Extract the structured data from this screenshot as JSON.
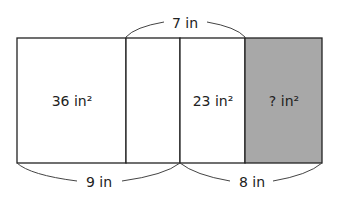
{
  "diagram": {
    "top_brace_label": "7 in",
    "bottom_left_brace_label": "9 in",
    "bottom_right_brace_label": "8 in",
    "regions": [
      {
        "label": "36 in²",
        "fill": "#ffffff"
      },
      {
        "label": "",
        "fill": "#ffffff"
      },
      {
        "label": "23 in²",
        "fill": "#ffffff"
      },
      {
        "label": "? in²",
        "fill": "#a8a8a8"
      }
    ],
    "colors": {
      "stroke": "#222222",
      "shaded": "#a8a8a8"
    }
  }
}
